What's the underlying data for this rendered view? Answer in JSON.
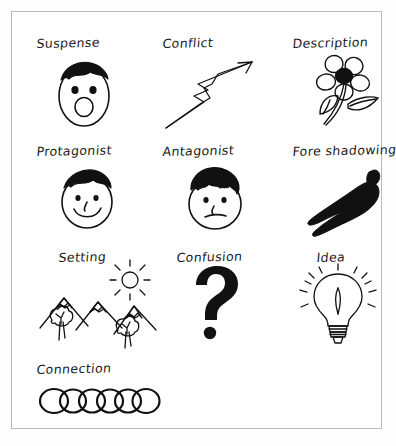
{
  "poster": {
    "title": "Story Elements Sketch Poster",
    "background_color": "#ffffff",
    "frame_color": "#b9b9b9",
    "ink_color": "#1a1a1a",
    "style": "hand-drawn black ink on white paper",
    "grid": {
      "columns": 3,
      "rows": 4
    }
  },
  "items": [
    {
      "label": "Suspense",
      "icon": "surprised-face-icon",
      "description": "oval face with spiky hair, two dot eyes and a round open mouth"
    },
    {
      "label": "Conflict",
      "icon": "lightning-bolt-icon",
      "description": "zigzag lightning bolt arrow pointing up to the right"
    },
    {
      "label": "Description",
      "icon": "flower-icon",
      "description": "five petal flower with dark center, curved stem and two leaves"
    },
    {
      "label": "Protagonist",
      "icon": "smiling-face-icon",
      "description": "round face with hair, dot eyes, small nose and a smile"
    },
    {
      "label": "Antagonist",
      "icon": "frowning-face-icon",
      "description": "round face with frizzy hair, dot eyes and a flat frowning mouth"
    },
    {
      "label": "Fore shadowing",
      "icon": "shadow-figure-icon",
      "description": "solid black silhouette of a person casting a long shadow"
    },
    {
      "label": "Setting",
      "icon": "mountain-landscape-icon",
      "description": "three snow capped mountains with two trees and a sun with rays"
    },
    {
      "label": "Confusion",
      "icon": "question-mark-icon",
      "description": "large bold question mark"
    },
    {
      "label": "Idea",
      "icon": "lightbulb-icon",
      "description": "light bulb with filament, screw base and radiating light rays"
    },
    {
      "label": "Connection",
      "icon": "chain-links-icon",
      "description": "row of six overlapping interlocking rings forming a chain"
    }
  ]
}
